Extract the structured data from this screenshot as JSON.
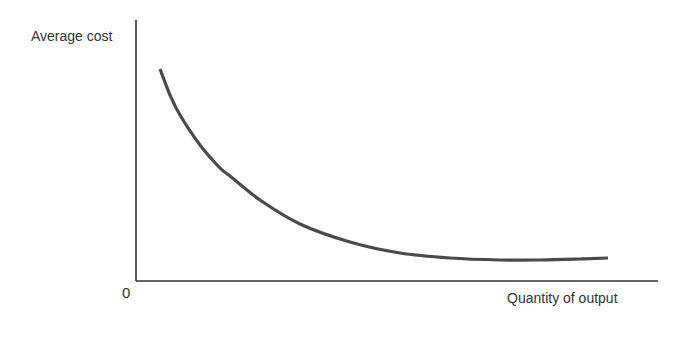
{
  "chart_data": {
    "type": "line",
    "title": "",
    "xlabel": "Quantity of output",
    "ylabel": "Average cost",
    "origin_label": "0",
    "grid": false,
    "legend": null,
    "axis_ticks": "none (conceptual diagram; only origin labelled 0)",
    "series": [
      {
        "name": "Average cost curve",
        "shape": "downward-sloping convex curve that flattens out toward a minimum",
        "color": "#4a4a4a",
        "points_px": [
          [
            160,
            69
          ],
          [
            170,
            95
          ],
          [
            180,
            115
          ],
          [
            200,
            145
          ],
          [
            220,
            168
          ],
          [
            230,
            176
          ],
          [
            260,
            200
          ],
          [
            300,
            224
          ],
          [
            350,
            242
          ],
          [
            400,
            253
          ],
          [
            450,
            258
          ],
          [
            500,
            260
          ],
          [
            540,
            260
          ],
          [
            580,
            259
          ],
          [
            608,
            258
          ]
        ]
      }
    ]
  },
  "axes": {
    "y_axis": {
      "x": 136,
      "y_top": 20,
      "y_bottom": 281
    },
    "x_axis": {
      "y": 281,
      "x_left": 136,
      "x_right": 658
    },
    "color": "#333333"
  }
}
